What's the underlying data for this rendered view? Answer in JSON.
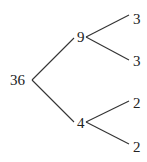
{
  "diagram": {
    "type": "factor-tree",
    "nodes": [
      {
        "id": "root",
        "label": "36",
        "x": 10,
        "y": 85
      },
      {
        "id": "n9",
        "label": "9",
        "x": 77,
        "y": 42
      },
      {
        "id": "n4",
        "label": "4",
        "x": 77,
        "y": 128
      },
      {
        "id": "n9a",
        "label": "3",
        "x": 133,
        "y": 24
      },
      {
        "id": "n9b",
        "label": "3",
        "x": 133,
        "y": 66
      },
      {
        "id": "n4a",
        "label": "2",
        "x": 133,
        "y": 108
      },
      {
        "id": "n4b",
        "label": "2",
        "x": 133,
        "y": 152
      }
    ],
    "edges": [
      {
        "from": "root",
        "to": "n9"
      },
      {
        "from": "root",
        "to": "n4"
      },
      {
        "from": "n9",
        "to": "n9a"
      },
      {
        "from": "n9",
        "to": "n9b"
      },
      {
        "from": "n4",
        "to": "n4a"
      },
      {
        "from": "n4",
        "to": "n4b"
      }
    ]
  }
}
